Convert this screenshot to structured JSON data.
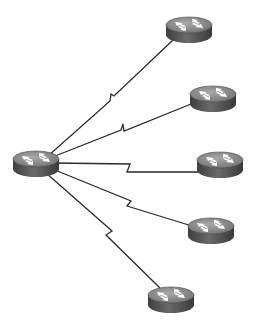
{
  "diagram": {
    "type": "hub-and-spoke network topology",
    "colors": {
      "background": "#ffffff",
      "link": "#2a2a2a",
      "router_top": "#8a8a8a",
      "router_side": "#555555",
      "router_arrows": "#ffffff"
    },
    "hub": {
      "id": "hub-router",
      "icon": "router-icon",
      "cx": 36,
      "cy": 162
    },
    "spokes": [
      {
        "id": "router-1",
        "icon": "router-icon",
        "cx": 189,
        "cy": 28,
        "link": "serial-wan"
      },
      {
        "id": "router-2",
        "icon": "router-icon",
        "cx": 212,
        "cy": 97,
        "link": "serial-wan"
      },
      {
        "id": "router-3",
        "icon": "router-icon",
        "cx": 220,
        "cy": 163,
        "link": "serial-wan"
      },
      {
        "id": "router-4",
        "icon": "router-icon",
        "cx": 211,
        "cy": 229,
        "link": "serial-wan"
      },
      {
        "id": "router-5",
        "icon": "router-icon",
        "cx": 170,
        "cy": 298,
        "link": "serial-wan"
      }
    ]
  }
}
